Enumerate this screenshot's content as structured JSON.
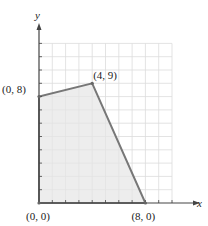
{
  "chart_data": {
    "type": "area",
    "title": "",
    "xlabel": "x",
    "ylabel": "y",
    "xlim": [
      0,
      10
    ],
    "ylim": [
      0,
      12
    ],
    "grid": true,
    "region": {
      "name": "feasible region",
      "vertices": [
        [
          0,
          0
        ],
        [
          0,
          8
        ],
        [
          4,
          9
        ],
        [
          8,
          0
        ]
      ],
      "fill": "#e6e6e6",
      "stroke": "#777777"
    },
    "points": [
      {
        "x": 0,
        "y": 0,
        "label": "(0, 0)"
      },
      {
        "x": 0,
        "y": 8,
        "label": "(0, 8)"
      },
      {
        "x": 4,
        "y": 9,
        "label": "(4, 9)"
      },
      {
        "x": 8,
        "y": 0,
        "label": "(8, 0)"
      }
    ]
  }
}
